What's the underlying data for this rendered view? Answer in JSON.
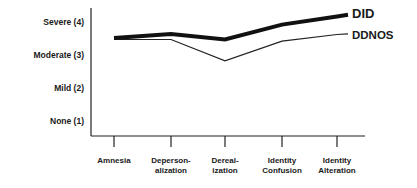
{
  "chart_data": {
    "type": "line",
    "title": "",
    "xlabel": "",
    "ylabel": "",
    "categories": [
      "Amnesia",
      "Depersonalization",
      "Derealization",
      "Identity Confusion",
      "Identity Alteration"
    ],
    "category_labels": [
      [
        "Amnesia",
        ""
      ],
      [
        "Deperson-",
        "alization"
      ],
      [
        "Dereal-",
        "ization"
      ],
      [
        "Identity",
        "Confusion"
      ],
      [
        "Identity",
        "Alteration"
      ]
    ],
    "y_ticks": [
      "None (1)",
      "Mild (2)",
      "Moderate (3)",
      "Severe (4)"
    ],
    "ylim": [
      0.6,
      4.6
    ],
    "grid": false,
    "legend_position": "right, inline at line ends",
    "series": [
      {
        "name": "DID",
        "values": [
          3.55,
          3.67,
          3.5,
          3.95,
          4.2
        ],
        "style": "thick"
      },
      {
        "name": "DDNOS",
        "values": [
          3.5,
          3.5,
          2.85,
          3.45,
          3.65
        ],
        "style": "thin"
      }
    ]
  }
}
